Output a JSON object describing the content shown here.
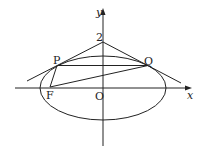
{
  "diagram": {
    "axes": {
      "x_label": "x",
      "y_label": "y",
      "origin_label": "O"
    },
    "points": {
      "P": "P",
      "Q": "Q",
      "F": "F",
      "y_intercept": "2"
    },
    "colors": {
      "stroke": "#222222",
      "background": "#ffffff"
    }
  }
}
